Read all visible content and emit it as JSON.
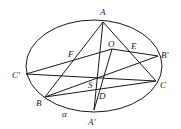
{
  "diagram": {
    "stroke_color": "#1a1a1a",
    "ellipse": {
      "cx": 94,
      "cy": 66,
      "rx": 68,
      "ry": 46,
      "label": "α"
    },
    "points": {
      "A": {
        "label": "A",
        "x": 103,
        "y": 22
      },
      "O": {
        "label": "O",
        "x": 112,
        "y": 49
      },
      "E": {
        "label": "E",
        "x": 128,
        "y": 52
      },
      "B'": {
        "label": "B'",
        "x": 158,
        "y": 56
      },
      "F": {
        "label": "F",
        "x": 74,
        "y": 60
      },
      "C'": {
        "label": "C'",
        "x": 26,
        "y": 74
      },
      "S": {
        "label": "S",
        "x": 96,
        "y": 80
      },
      "C": {
        "label": "C",
        "x": 156,
        "y": 81
      },
      "D": {
        "label": "D",
        "x": 97,
        "y": 94
      },
      "B": {
        "label": "B",
        "x": 45,
        "y": 97
      },
      "A'": {
        "label": "A'",
        "x": 94,
        "y": 110
      }
    },
    "segments": [
      [
        "A",
        "B"
      ],
      [
        "A",
        "A'"
      ],
      [
        "A",
        "C"
      ],
      [
        "C'",
        "O"
      ],
      [
        "O",
        "B'"
      ],
      [
        "O",
        "A'"
      ],
      [
        "C'",
        "C"
      ],
      [
        "B",
        "B'"
      ],
      [
        "B",
        "C"
      ]
    ],
    "labels": [
      {
        "text": "A",
        "x": 100,
        "y": 15
      },
      {
        "text": "O",
        "x": 108,
        "y": 47
      },
      {
        "text": "E",
        "x": 131,
        "y": 49
      },
      {
        "text": "B′",
        "x": 161,
        "y": 58
      },
      {
        "text": "F",
        "x": 68,
        "y": 57
      },
      {
        "text": "C′",
        "x": 12,
        "y": 78
      },
      {
        "text": "S",
        "x": 88,
        "y": 88
      },
      {
        "text": "C",
        "x": 160,
        "y": 88
      },
      {
        "text": "D",
        "x": 99,
        "y": 99
      },
      {
        "text": "B",
        "x": 36,
        "y": 106
      },
      {
        "text": "α",
        "x": 62,
        "y": 117
      },
      {
        "text": "A′",
        "x": 88,
        "y": 125
      }
    ]
  }
}
